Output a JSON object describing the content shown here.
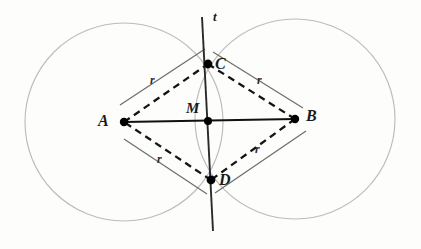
{
  "figure": {
    "background_color": "#fdfdfc",
    "stroke_colors": {
      "circle": "#b9b9b9",
      "rhombus_dashed": "#141414",
      "segment_ab": "#111111",
      "line_t": "#2a2a2a",
      "measure_line": "#6e6e6e",
      "point_dot": "#000000",
      "label": "#1a1a1a"
    },
    "points": [
      {
        "id": "A",
        "label": "A",
        "cx": 124,
        "cy": 122,
        "label_x": 98,
        "label_y": 113,
        "dot_r": 4.2
      },
      {
        "id": "B",
        "label": "B",
        "cx": 295,
        "cy": 119,
        "label_x": 306,
        "label_y": 108,
        "dot_r": 4.2
      },
      {
        "id": "C",
        "label": "C",
        "cx": 208,
        "cy": 64,
        "label_x": 215,
        "label_y": 56,
        "dot_r": 4.4
      },
      {
        "id": "D",
        "label": "D",
        "cx": 211,
        "cy": 180,
        "label_x": 219,
        "label_y": 172,
        "dot_r": 4.4
      },
      {
        "id": "M",
        "label": "M",
        "cx": 208,
        "cy": 121,
        "label_x": 186,
        "label_y": 101,
        "dot_r": 4.0
      }
    ],
    "line_t": {
      "label": "t",
      "label_x": 213,
      "label_y": 10,
      "x1": 202,
      "y1": 17,
      "x2": 213,
      "y2": 231
    },
    "circles": [
      {
        "id": "circle-A",
        "center": "A",
        "cx": 124,
        "cy": 122,
        "r": 99
      },
      {
        "id": "circle-B",
        "center": "B",
        "cx": 295,
        "cy": 119,
        "r": 100
      }
    ],
    "segment_ab": {
      "x1": 124,
      "y1": 122,
      "x2": 295,
      "y2": 119
    },
    "rhombus_edges": [
      {
        "id": "AC",
        "x1": 124,
        "y1": 122,
        "x2": 208,
        "y2": 64
      },
      {
        "id": "CB",
        "x1": 208,
        "y1": 64,
        "x2": 295,
        "y2": 119
      },
      {
        "id": "BD",
        "x1": 295,
        "y1": 119,
        "x2": 211,
        "y2": 180
      },
      {
        "id": "DA",
        "x1": 211,
        "y1": 180,
        "x2": 124,
        "y2": 122
      }
    ],
    "measure_marks": [
      {
        "id": "r-upper-left",
        "label": "r",
        "x1": 120,
        "y1": 105,
        "x2": 205,
        "y2": 49,
        "label_x": 150,
        "label_y": 74
      },
      {
        "id": "r-upper-right",
        "label": "r",
        "x1": 213,
        "y1": 52,
        "x2": 303,
        "y2": 108,
        "label_x": 257,
        "label_y": 74
      },
      {
        "id": "r-lower-left",
        "label": "r",
        "x1": 124,
        "y1": 139,
        "x2": 207,
        "y2": 194,
        "label_x": 157,
        "label_y": 153
      },
      {
        "id": "r-lower-right",
        "label": "r",
        "x1": 215,
        "y1": 193,
        "x2": 306,
        "y2": 131,
        "label_x": 255,
        "label_y": 143
      }
    ],
    "radius_symbol": "r"
  }
}
